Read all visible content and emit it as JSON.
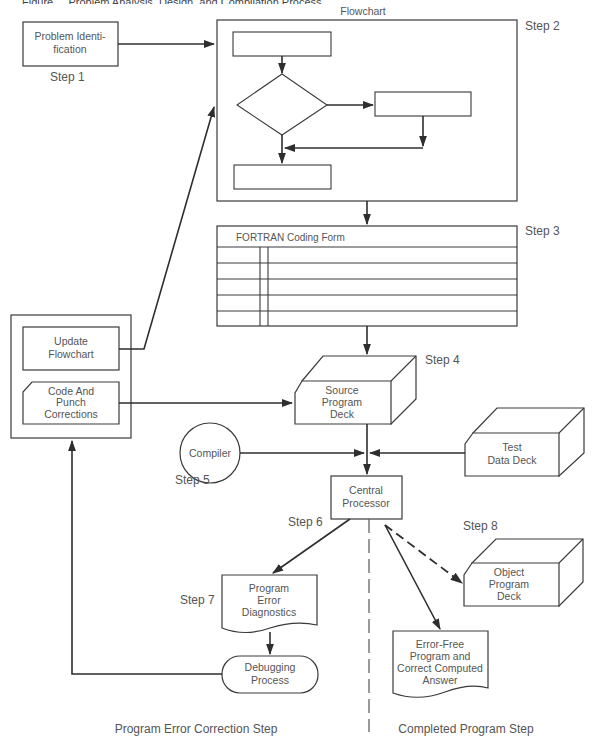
{
  "figure_title": "Figure ... Problem Analysis, Design, and Compilation Process",
  "colors": {
    "line": "#2e2e2e",
    "text": "#555555",
    "background": "#ffffff"
  },
  "steps": {
    "step1": "Step 1",
    "step2": "Step 2",
    "step3": "Step 3",
    "step4": "Step 4",
    "step5": "Step 5",
    "step6": "Step 6",
    "step7": "Step 7",
    "step8": "Step 8"
  },
  "nodes": {
    "problem_identification": {
      "lines": [
        "Problem Identi-",
        "fication"
      ]
    },
    "flowchart": {
      "title": "Flowchart"
    },
    "coding_form": {
      "title": "FORTRAN Coding Form",
      "rows": 5
    },
    "update_flowchart": {
      "lines": [
        "Update",
        "Flowchart"
      ]
    },
    "code_punch": {
      "lines": [
        "Code And",
        "Punch",
        "Corrections"
      ]
    },
    "source_deck": {
      "lines": [
        "Source",
        "Program",
        "Deck"
      ]
    },
    "compiler": {
      "label": "Compiler"
    },
    "test_data_deck": {
      "lines": [
        "Test",
        "Data Deck"
      ]
    },
    "central_processor": {
      "lines": [
        "Central",
        "Processor"
      ]
    },
    "error_diagnostics": {
      "lines": [
        "Program",
        "Error",
        "Diagnostics"
      ]
    },
    "debugging": {
      "lines": [
        "Debugging",
        "Process"
      ]
    },
    "object_deck": {
      "lines": [
        "Object",
        "Program",
        "Deck"
      ]
    },
    "error_free": {
      "lines": [
        "Error-Free",
        "Program and",
        "Correct Computed",
        "Answer"
      ]
    }
  },
  "sections": {
    "left": "Program Error Correction Step",
    "right": "Completed Program Step"
  }
}
